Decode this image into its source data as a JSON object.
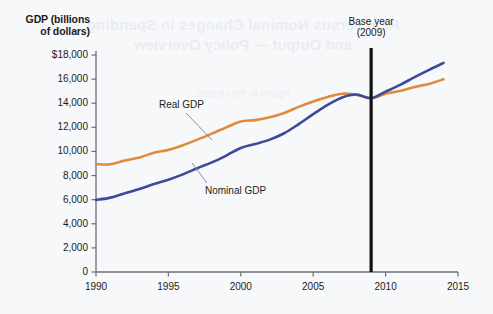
{
  "chart_data": {
    "type": "line",
    "title": "",
    "xlabel": "",
    "ylabel": "GDP (billions of dollars)",
    "xlim": [
      1990,
      2015
    ],
    "ylim": [
      0,
      18000
    ],
    "grid": false,
    "legend_position": "inline-annotations",
    "x_ticks": [
      "1990",
      "1995",
      "2000",
      "2005",
      "2010",
      "2015"
    ],
    "x_tick_values": [
      1990,
      1995,
      2000,
      2005,
      2010,
      2015
    ],
    "y_ticks": [
      "0",
      "2,000",
      "4,000",
      "6,000",
      "8,000",
      "10,000",
      "12,000",
      "14,000",
      "16,000",
      "$18,000"
    ],
    "y_tick_values": [
      0,
      2000,
      4000,
      6000,
      8000,
      10000,
      12000,
      14000,
      16000,
      18000
    ],
    "x": [
      1990,
      1991,
      1992,
      1993,
      1994,
      1995,
      1996,
      1997,
      1998,
      1999,
      2000,
      2001,
      2002,
      2003,
      2004,
      2005,
      2006,
      2007,
      2008,
      2009,
      2010,
      2011,
      2012,
      2013,
      2014
    ],
    "series": [
      {
        "name": "Real GDP",
        "color": "#E08A3C",
        "values": [
          8950,
          8940,
          9250,
          9500,
          9890,
          10130,
          10510,
          10980,
          11480,
          12000,
          12480,
          12600,
          12830,
          13190,
          13700,
          14150,
          14520,
          14790,
          14690,
          14420,
          14780,
          15020,
          15350,
          15600,
          15990
        ]
      },
      {
        "name": "Nominal GDP",
        "color": "#3B4A9A",
        "values": [
          5980,
          6170,
          6540,
          6880,
          7300,
          7660,
          8100,
          8610,
          9090,
          9660,
          10290,
          10620,
          10980,
          11510,
          12270,
          13090,
          13860,
          14480,
          14720,
          14420,
          14960,
          15520,
          16160,
          16770,
          17350
        ]
      }
    ],
    "annotations": [
      {
        "name": "base-year",
        "label_line1": "Base year",
        "label_line2": "(2009)",
        "x": 2009
      },
      {
        "name": "real-gdp-callout",
        "label": "Real GDP"
      },
      {
        "name": "nominal-gdp-callout",
        "label": "Nominal GDP"
      }
    ]
  },
  "axis": {
    "y_title_line1": "GDP (billions",
    "y_title_line2": "of dollars)"
  },
  "annotations": {
    "base_year_line1": "Base year",
    "base_year_line2": "(2009)",
    "real_gdp": "Real GDP",
    "nominal_gdp": "Nominal GDP"
  },
  "bleed": {
    "line1": "Real versus Nominal Changes in Spending",
    "line2": "and Output — Policy Overview",
    "line3": "figures in the chapter"
  },
  "colors": {
    "real_gdp": "#E08A3C",
    "nominal_gdp": "#3B4A9A",
    "axis": "#6b7076",
    "base_year_line": "#111111",
    "background": "#f7f8fa"
  }
}
